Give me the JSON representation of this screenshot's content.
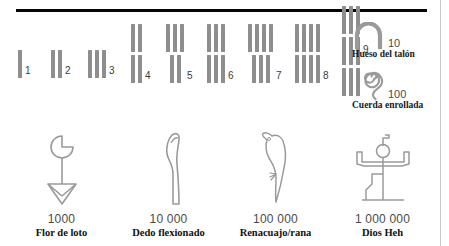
{
  "figure": {
    "colors": {
      "stroke_gray": "#8e8e8e",
      "glyph_outline": "#9a9a9a",
      "rule_black": "#050505",
      "value_text": "#4a4a4a",
      "name_text": "#111111",
      "background": "#ffffff"
    },
    "numerals": [
      {
        "label": "1",
        "rows": [
          1
        ]
      },
      {
        "label": "2",
        "rows": [
          2
        ]
      },
      {
        "label": "3",
        "rows": [
          3
        ]
      },
      {
        "label": "4",
        "rows": [
          2,
          2
        ]
      },
      {
        "label": "5",
        "rows": [
          3,
          2
        ]
      },
      {
        "label": "6",
        "rows": [
          3,
          3
        ]
      },
      {
        "label": "7",
        "rows": [
          4,
          3
        ]
      },
      {
        "label": "8",
        "rows": [
          4,
          4
        ]
      },
      {
        "label": "9",
        "rows": [
          3,
          3,
          3
        ]
      }
    ],
    "legend_right": [
      {
        "value": "10",
        "name": "Hueso del talón",
        "icon": "heel-bone-icon"
      },
      {
        "value": "100",
        "name": "Cuerda enrollada",
        "icon": "coiled-rope-icon"
      }
    ],
    "large_symbols": [
      {
        "value": "1000",
        "name": "Flor de loto",
        "icon": "lotus-flower-icon"
      },
      {
        "value": "10 000",
        "name": "Dedo flexionado",
        "icon": "bent-finger-icon"
      },
      {
        "value": "100 000",
        "name": "Renacuajo/rana",
        "icon": "tadpole-frog-icon"
      },
      {
        "value": "1 000 000",
        "name": "Dios Heh",
        "icon": "heh-god-icon"
      }
    ]
  }
}
